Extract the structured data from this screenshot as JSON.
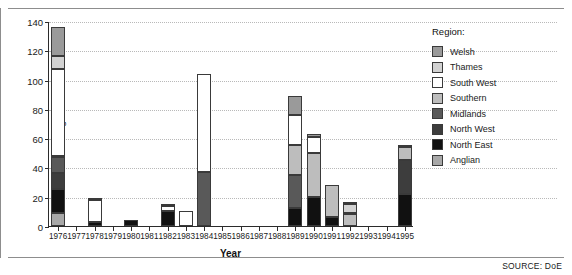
{
  "figure": {
    "source_note": "SOURCE: DoE"
  },
  "legend": {
    "title": "Region:",
    "items": [
      {
        "label": "Welsh",
        "color": "#9a9a9a"
      },
      {
        "label": "Thames",
        "color": "#d2d2d2"
      },
      {
        "label": "South West",
        "color": "#ffffff"
      },
      {
        "label": "Southern",
        "color": "#bdbdbd"
      },
      {
        "label": "Midlands",
        "color": "#595959"
      },
      {
        "label": "North West",
        "color": "#3d3d3d"
      },
      {
        "label": "North East",
        "color": "#111111"
      },
      {
        "label": "Anglian",
        "color": "#a8a8a8"
      }
    ]
  },
  "chart_data": {
    "type": "bar",
    "subtype": "stacked",
    "title": "",
    "xlabel": "Year",
    "ylabel": "Number of drought orders",
    "ylim": [
      0,
      140
    ],
    "yticks": [
      0,
      20,
      40,
      60,
      80,
      100,
      120,
      140
    ],
    "grid": true,
    "legend_position": "right",
    "categories": [
      "1976",
      "1977",
      "1978",
      "1979",
      "1980",
      "1981",
      "1982",
      "1983",
      "1984",
      "1985",
      "1986",
      "1987",
      "1988",
      "1989",
      "1990",
      "1991",
      "1992",
      "1993",
      "1994",
      "1995"
    ],
    "stack_order_bottom_to_top": [
      "Anglian",
      "North East",
      "North West",
      "Midlands",
      "Southern",
      "South West",
      "Thames",
      "Welsh"
    ],
    "series": [
      {
        "name": "Anglian",
        "color": "#a8a8a8",
        "values": [
          9,
          0,
          0,
          0,
          0,
          0,
          0,
          0,
          0,
          0,
          0,
          0,
          0,
          0,
          0,
          0,
          0,
          0,
          0,
          0
        ]
      },
      {
        "name": "North East",
        "color": "#111111",
        "values": [
          16,
          0,
          3,
          0,
          4,
          0,
          10,
          0,
          0,
          0,
          0,
          0,
          0,
          12,
          20,
          6,
          0,
          0,
          0,
          22
        ]
      },
      {
        "name": "North West",
        "color": "#3d3d3d",
        "values": [
          11,
          0,
          0,
          0,
          0,
          0,
          0,
          0,
          0,
          0,
          0,
          0,
          0,
          0,
          0,
          0,
          0,
          0,
          0,
          23
        ]
      },
      {
        "name": "Midlands",
        "color": "#595959",
        "values": [
          11,
          0,
          0,
          0,
          0,
          0,
          0,
          0,
          37,
          0,
          0,
          0,
          0,
          23,
          0,
          0,
          0,
          0,
          0,
          0
        ]
      },
      {
        "name": "Southern",
        "color": "#bdbdbd",
        "values": [
          1,
          0,
          0,
          0,
          0,
          0,
          0,
          0,
          0,
          0,
          0,
          0,
          0,
          20,
          30,
          22,
          8,
          0,
          0,
          9
        ]
      },
      {
        "name": "South West",
        "color": "#ffffff",
        "values": [
          59,
          0,
          15,
          0,
          0,
          0,
          4,
          10,
          67,
          0,
          0,
          0,
          0,
          21,
          11,
          0,
          1,
          0,
          0,
          0
        ]
      },
      {
        "name": "Thames",
        "color": "#d2d2d2",
        "values": [
          9,
          0,
          0,
          0,
          0,
          0,
          0,
          0,
          0,
          0,
          0,
          0,
          0,
          0,
          0,
          0,
          6,
          0,
          0,
          0
        ]
      },
      {
        "name": "Welsh",
        "color": "#9a9a9a",
        "values": [
          20,
          0,
          1,
          0,
          0,
          0,
          1,
          0,
          0,
          0,
          0,
          0,
          0,
          13,
          2,
          0,
          1,
          0,
          0,
          1
        ]
      }
    ],
    "totals": [
      136,
      0,
      19,
      0,
      4,
      0,
      15,
      10,
      104,
      0,
      0,
      0,
      0,
      89,
      63,
      28,
      16,
      0,
      0,
      55
    ]
  }
}
